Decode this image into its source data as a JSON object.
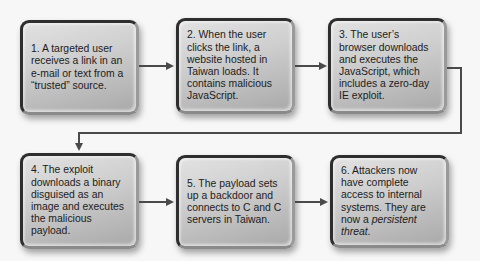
{
  "diagram": {
    "type": "flowchart",
    "steps": [
      {
        "id": 1,
        "text": "1.  A targeted user receives a link in an e-mail or text from a “trusted” source."
      },
      {
        "id": 2,
        "text": "2.  When the user clicks the link, a website hosted in Taiwan loads. It contains malicious JavaScript."
      },
      {
        "id": 3,
        "text": "3.  The user’s browser downloads and executes the JavaScript, which includes a zero-day IE exploit."
      },
      {
        "id": 4,
        "text": "4.  The exploit downloads a binary disguised as an image and executes the malicious payload."
      },
      {
        "id": 5,
        "text": "5.  The payload sets up a backdoor and connects to C and C servers in Taiwan."
      },
      {
        "id": 6,
        "text_before": "6.  Attackers now have complete access to internal systems. They are now a ",
        "text_italic": "persistent threat",
        "text_after": "."
      }
    ],
    "connections": [
      {
        "from": 1,
        "to": 2,
        "icon": "arrow-right-icon"
      },
      {
        "from": 2,
        "to": 3,
        "icon": "arrow-right-icon"
      },
      {
        "from": 3,
        "to": 4,
        "icon": "arrow-down-icon",
        "route": "elbow"
      },
      {
        "from": 4,
        "to": 5,
        "icon": "arrow-right-icon"
      },
      {
        "from": 5,
        "to": 6,
        "icon": "arrow-right-icon"
      }
    ],
    "colors": {
      "background": "#f7f7f7",
      "box_border": "#2e2e2e",
      "box_fill_light": "#e2e2e2",
      "box_fill_dark": "#a9a9a9",
      "connector": "#4a4a4a",
      "text": "#1c1c1c"
    }
  }
}
